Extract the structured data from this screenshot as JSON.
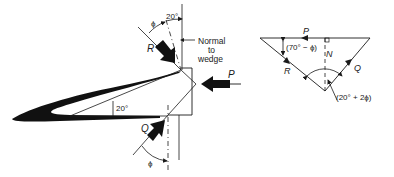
{
  "wedge_diagram": {
    "labels": {
      "R": "R",
      "P": "P",
      "Q": "Q",
      "phi_top": "ϕ",
      "phi_bottom": "ϕ",
      "angle_top": "20°",
      "angle_wedge": "20°",
      "normal_line1": "Normal",
      "normal_line2": "to",
      "normal_line3": "wedge"
    }
  },
  "force_triangle": {
    "labels": {
      "P": "P",
      "R": "R",
      "Q": "Q",
      "N": "N",
      "angle_left": "(70° − ϕ)",
      "angle_bottom": "(20° + 2ϕ)"
    }
  },
  "colors": {
    "ink": "#1a1a1a",
    "background": "#ffffff"
  }
}
